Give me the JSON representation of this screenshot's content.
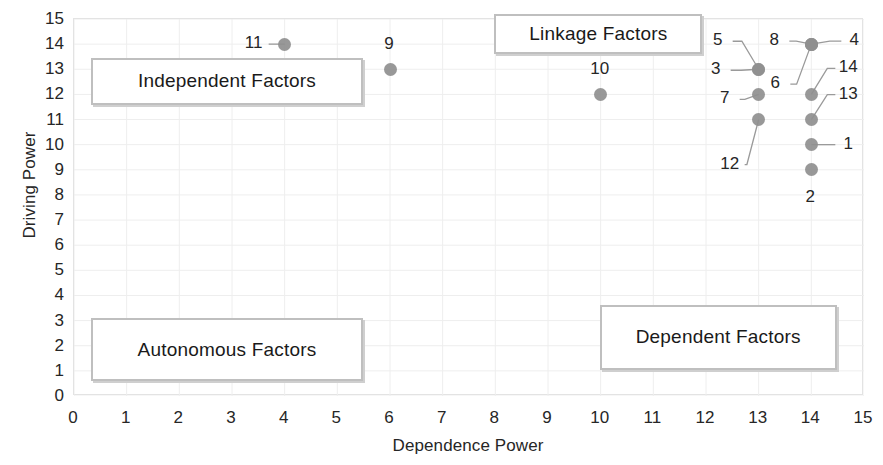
{
  "chart_data": {
    "type": "scatter",
    "title": "",
    "xlabel": "Dependence Power",
    "ylabel": "Driving Power",
    "xlim": [
      0,
      15
    ],
    "ylim": [
      0,
      15
    ],
    "xticks": [
      "0",
      "1",
      "2",
      "3",
      "4",
      "5",
      "6",
      "7",
      "8",
      "9",
      "10",
      "11",
      "12",
      "13",
      "14",
      "15"
    ],
    "yticks": [
      "15",
      "14",
      "13",
      "12",
      "11",
      "10",
      "9",
      "8",
      "7",
      "6",
      "5",
      "4",
      "3",
      "2",
      "1",
      "0"
    ],
    "grid": true,
    "legend": "none",
    "marker_color": "#8f8f8f",
    "points": [
      {
        "label": "11",
        "x": 4,
        "y": 14,
        "lx": -30,
        "ly": 0,
        "leader": true
      },
      {
        "label": "9",
        "x": 6,
        "y": 13,
        "lx": 0,
        "ly": -24,
        "leader": false
      },
      {
        "label": "10",
        "x": 10,
        "y": 12,
        "lx": 0,
        "ly": -24,
        "leader": false
      },
      {
        "label": "5",
        "x": 13,
        "y": 13,
        "lx": -40,
        "ly": -28,
        "leader": true
      },
      {
        "label": "3",
        "x": 13,
        "y": 13,
        "lx": -42,
        "ly": 1,
        "leader": true
      },
      {
        "label": "7",
        "x": 13,
        "y": 12,
        "lx": -33,
        "ly": 5,
        "leader": true
      },
      {
        "label": "12",
        "x": 13,
        "y": 11,
        "lx": -28,
        "ly": 45,
        "leader": true
      },
      {
        "label": "8",
        "x": 14,
        "y": 14,
        "lx": -36,
        "ly": -3,
        "leader": true
      },
      {
        "label": "4",
        "x": 14,
        "y": 14,
        "lx": 44,
        "ly": -3,
        "leader": true
      },
      {
        "label": "6",
        "x": 14,
        "y": 14,
        "lx": -35,
        "ly": 40,
        "leader": true
      },
      {
        "label": "14",
        "x": 14,
        "y": 12,
        "lx": 38,
        "ly": -26,
        "leader": true
      },
      {
        "label": "13",
        "x": 14,
        "y": 11,
        "lx": 38,
        "ly": -25,
        "leader": true
      },
      {
        "label": "1",
        "x": 14,
        "y": 10,
        "lx": 38,
        "ly": 0,
        "leader": true
      },
      {
        "label": "2",
        "x": 14,
        "y": 9,
        "lx": 0,
        "ly": 28,
        "leader": false
      }
    ],
    "quadrants": [
      {
        "name": "independent",
        "label": "Independent Factors",
        "x": 0.35,
        "y": 13.4,
        "w": 5.15,
        "h": 1.85
      },
      {
        "name": "linkage",
        "label": "Linkage Factors",
        "x": 8.0,
        "y": 15.15,
        "w": 3.95,
        "h": 1.6
      },
      {
        "name": "autonomous",
        "label": "Autonomous Factors",
        "x": 0.35,
        "y": 3.05,
        "w": 5.15,
        "h": 2.5
      },
      {
        "name": "dependent",
        "label": "Dependent Factors",
        "x": 10.0,
        "y": 3.6,
        "w": 4.5,
        "h": 2.6
      }
    ]
  }
}
